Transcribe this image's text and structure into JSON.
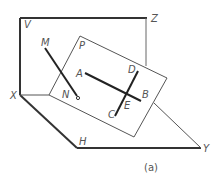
{
  "diagram": {
    "caption": "(a)",
    "planes": {
      "vertical": {
        "label": "V"
      },
      "horizontal": {
        "label": "H"
      },
      "oblique": {
        "label": "P"
      }
    },
    "axes": {
      "x": "X",
      "y": "Y",
      "z": "Z"
    },
    "lines": [
      {
        "name": "MN",
        "start": "M",
        "end": "N"
      },
      {
        "name": "AB",
        "start": "A",
        "end": "B"
      },
      {
        "name": "CD",
        "start": "C",
        "end": "D"
      }
    ],
    "points": {
      "M": "M",
      "N": "N",
      "A": "A",
      "B": "B",
      "C": "C",
      "D": "D",
      "E": "E",
      "P": "P",
      "V": "V",
      "H": "H",
      "X": "X",
      "Y": "Y",
      "Z": "Z"
    },
    "colors": {
      "stroke": "#333333",
      "thin": "#555555",
      "label": "#555555"
    }
  }
}
